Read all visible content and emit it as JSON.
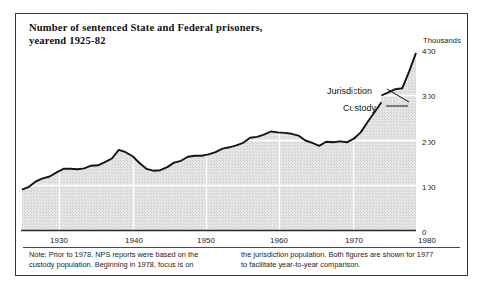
{
  "figure": {
    "title_line1": "Number of sentenced State and Federal prisoners,",
    "title_line2": "yearend 1925-82",
    "units_label": "Thousands",
    "annotations": [
      {
        "name": "jurisdiction",
        "label": "Jurisdiction"
      },
      {
        "name": "custody",
        "label": "Custody"
      }
    ],
    "note": {
      "col1": "Note: Prior to 1978, NPS reports were based on the custody population. Beginning in 1978, focus is on",
      "col2": "the jurisdiction population. Both figures are shown for 1977 to facilitate year-to-year comparison."
    }
  },
  "chart_data": {
    "type": "area",
    "title": "Number of sentenced State and Federal prisoners, yearend 1925-82",
    "xlabel": "",
    "ylabel": "Thousands",
    "ylim": [
      0,
      400
    ],
    "xlim": [
      1925,
      1982
    ],
    "yticks": [
      0,
      100,
      200,
      300,
      400
    ],
    "ytick_labels": [
      "0",
      "100",
      "200",
      "300",
      "400"
    ],
    "xticks": [
      1930,
      1940,
      1950,
      1960,
      1970,
      1980
    ],
    "xtick_labels": [
      "1930",
      "1940",
      "1950",
      "1960",
      "1970",
      "1980"
    ],
    "grid": true,
    "legend": "none",
    "series": [
      {
        "name": "Custody",
        "x": [
          1925,
          1926,
          1927,
          1928,
          1929,
          1930,
          1931,
          1932,
          1933,
          1934,
          1935,
          1936,
          1937,
          1938,
          1939,
          1940,
          1941,
          1942,
          1943,
          1944,
          1945,
          1946,
          1947,
          1948,
          1949,
          1950,
          1951,
          1952,
          1953,
          1954,
          1955,
          1956,
          1957,
          1958,
          1959,
          1960,
          1961,
          1962,
          1963,
          1964,
          1965,
          1966,
          1967,
          1968,
          1969,
          1970,
          1971,
          1972,
          1973,
          1974,
          1975,
          1976,
          1977
        ],
        "values": [
          91,
          97,
          109,
          116,
          120,
          129,
          137,
          137,
          136,
          138,
          144,
          145,
          152,
          160,
          179,
          174,
          165,
          150,
          137,
          133,
          134,
          141,
          151,
          155,
          164,
          166,
          166,
          169,
          174,
          182,
          185,
          189,
          195,
          206,
          208,
          213,
          220,
          218,
          217,
          215,
          211,
          200,
          195,
          188,
          197,
          196,
          198,
          196,
          204,
          218,
          241,
          263,
          285
        ]
      },
      {
        "name": "Jurisdiction",
        "x": [
          1977,
          1978,
          1979,
          1980,
          1981,
          1982
        ],
        "values": [
          300,
          307,
          314,
          316,
          353,
          395
        ]
      }
    ],
    "annotations": [
      {
        "text": "Jurisdiction",
        "points_to_year": 1977,
        "points_to_value": 300
      },
      {
        "text": "Custody",
        "points_to_year": 1977,
        "points_to_value": 285
      }
    ]
  }
}
